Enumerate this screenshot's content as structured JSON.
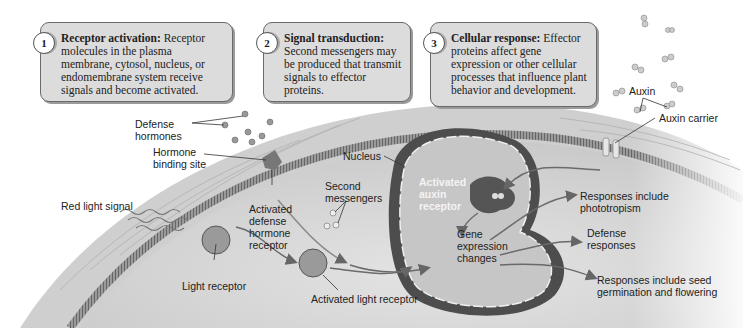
{
  "callouts": [
    {
      "number": "1",
      "title": "Receptor activation:",
      "text": "Receptor molecules in the plasma membrane, cytosol, nucleus, or endomembrane system receive signals and become activated."
    },
    {
      "number": "2",
      "title": "Signal transduction:",
      "text": "Second messengers may be produced that transmit signals to effector proteins."
    },
    {
      "number": "3",
      "title": "Cellular response:",
      "text": "Effector proteins affect gene expression or other cellular processes that influence plant behavior and development."
    }
  ],
  "labels": {
    "defense_hormones": "Defense hormones",
    "hormone_binding_site": "Hormone binding site",
    "red_light_signal": "Red light signal",
    "activated_defense_hormone_receptor": "Activated defense hormone receptor",
    "light_receptor": "Light receptor",
    "activated_light_receptor": "Activated light receptor",
    "second_messengers": "Second messengers",
    "nucleus": "Nucleus",
    "activated_auxin_receptor": "Activated auxin receptor",
    "gene_expression_changes": "Gene expression changes",
    "auxin": "Auxin",
    "auxin_carrier": "Auxin carrier",
    "responses_phototropism": "Responses include phototropism",
    "defense_responses": "Defense responses",
    "responses_seed": "Responses include seed germination and flowering"
  },
  "colors": {
    "callout_fill": "#dcdcdc",
    "cell_wall": "#c8c8c8",
    "cytosol": "#d6d6d6",
    "nucleus_envelope": "#4a4a4a",
    "nucleus_interior": "#c4c4c4",
    "arrow": "#707070"
  }
}
